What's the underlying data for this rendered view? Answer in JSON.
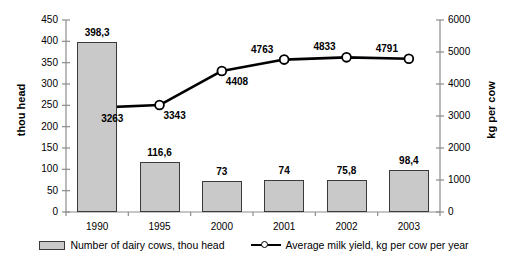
{
  "chart_data": {
    "type": "bar",
    "title": "",
    "subtitle": "",
    "xlabel": "",
    "ylabel": "thou head",
    "y2label": "kg per cow",
    "categories": [
      "1990",
      "1995",
      "2000",
      "2001",
      "2002",
      "2003"
    ],
    "grid": false,
    "legend_position": "bottom",
    "ylim": [
      0,
      450
    ],
    "y2lim": [
      0,
      6000
    ],
    "yticks": [
      0,
      50,
      100,
      150,
      200,
      250,
      300,
      350,
      400,
      450
    ],
    "y2ticks": [
      0,
      1000,
      2000,
      3000,
      4000,
      5000,
      6000
    ],
    "ytick_labels": [
      "0",
      "50",
      "100",
      "150",
      "200",
      "250",
      "300",
      "350",
      "400",
      "450"
    ],
    "y2tick_labels": [
      "0",
      "1000",
      "2000",
      "3000",
      "4000",
      "5000",
      "6000"
    ],
    "series": [
      {
        "name": "Number of dairy cows, thou head",
        "type": "bar",
        "axis": "left",
        "values": [
          398.3,
          116.6,
          73,
          74,
          75.8,
          98.4
        ],
        "data_labels": [
          "398,3",
          "116,6",
          "73",
          "74",
          "75,8",
          "98,4"
        ],
        "fill_color": "#c9c9c9",
        "edge_color": "#3a3a3a"
      },
      {
        "name": "Average milk yield, kg per cow per year",
        "type": "line",
        "axis": "right",
        "values": [
          3263,
          3343,
          4408,
          4763,
          4833,
          4791
        ],
        "data_labels": [
          "3263",
          "3343",
          "4408",
          "4763",
          "4833",
          "4791"
        ],
        "line_color": "#000000",
        "marker_face_color": "#ffffff",
        "marker_edge_color": "#000000"
      }
    ]
  },
  "legend": {
    "items": [
      {
        "label": "Number of dairy cows, thou head",
        "swatch": "bar-swatch"
      },
      {
        "label": "Average milk yield, kg per cow per year",
        "swatch": "line-marker-swatch"
      }
    ]
  },
  "axes": {
    "left_title": "thou head",
    "right_title": "kg per cow"
  },
  "colors": {
    "bar_fill": "#c9c9c9",
    "bar_edge": "#3a3a3a",
    "line": "#000000",
    "axis": "#808080",
    "text": "#000000",
    "background": "#ffffff"
  }
}
